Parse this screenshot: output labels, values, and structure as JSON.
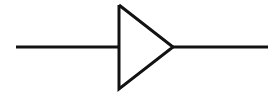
{
  "canvas": {
    "width": 279,
    "height": 94,
    "background_color": "#ffffff",
    "stroke_color": "#121212",
    "stroke_width": 3
  },
  "symbol": {
    "name": "buffer-amplifier-triangle",
    "type": "electronic-schematic-symbol",
    "description": "Triangle pointing right with horizontal lead lines on left and right"
  },
  "geometry": {
    "baseline_y": 47,
    "triangle": {
      "vertical_edge_x": 119,
      "top_vertex": {
        "x": 119,
        "y": 5
      },
      "bottom_vertex": {
        "x": 119,
        "y": 89
      },
      "apex": {
        "x": 173,
        "y": 47
      },
      "points": "119,5 173,47 119,89",
      "height": 84,
      "width": 54
    },
    "input_lead": {
      "x1": 16,
      "y1": 47,
      "x2": 120,
      "y2": 47,
      "length": 104
    },
    "output_lead": {
      "x1": 172,
      "y1": 47,
      "x2": 268,
      "y2": 47,
      "length": 96
    }
  }
}
